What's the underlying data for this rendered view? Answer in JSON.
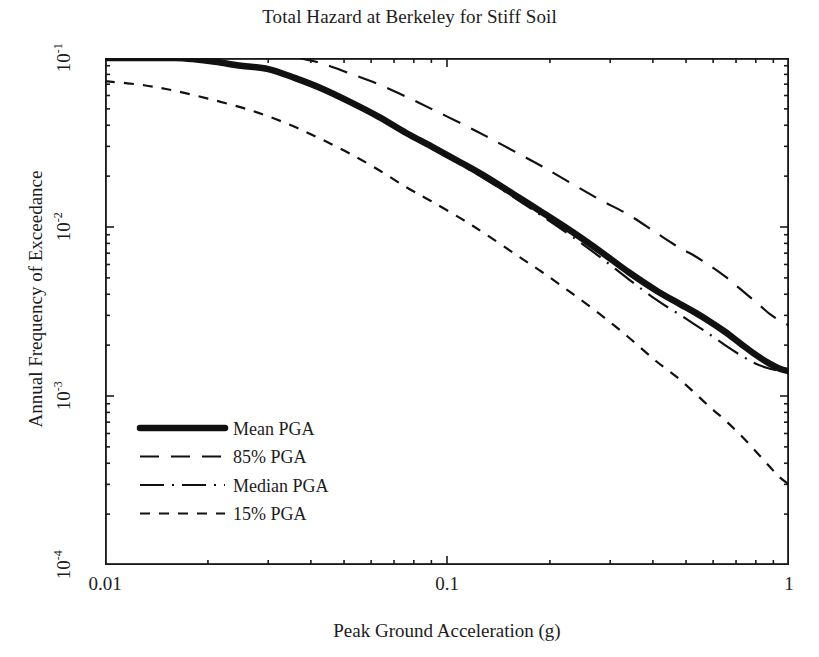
{
  "chart_data": {
    "type": "line",
    "title": "Total Hazard at Berkeley for Stiff Soil",
    "xlabel": "Peak Ground Acceleration (g)",
    "ylabel": "Annual Frequency of Exceedance",
    "xscale": "log",
    "yscale": "log",
    "xlim": [
      0.01,
      1
    ],
    "ylim": [
      0.0001,
      0.1
    ],
    "grid": false,
    "legend_position": "lower-left-inside",
    "xtick_labels": [
      "0.01",
      "0.1",
      "1"
    ],
    "xtick_values": [
      0.01,
      0.1,
      1
    ],
    "ytick_labels": [
      "10-1",
      "10-2",
      "10-3",
      "10-4"
    ],
    "ytick_values": [
      0.1,
      0.01,
      0.001,
      0.0001
    ],
    "ytick_mantissa": "10",
    "ytick_exponents": [
      "-1",
      "-2",
      "-3",
      "-4"
    ],
    "series": [
      {
        "name": "Mean PGA",
        "style": "thick-solid",
        "linewidth": 6,
        "dash": "none",
        "x": [
          0.01,
          0.013,
          0.016,
          0.018,
          0.021,
          0.025,
          0.03,
          0.036,
          0.043,
          0.052,
          0.063,
          0.076,
          0.09,
          0.11,
          0.13,
          0.16,
          0.19,
          0.23,
          0.28,
          0.34,
          0.41,
          0.48,
          0.52,
          0.58,
          0.65,
          0.72,
          0.8,
          0.88,
          0.94,
          1.0
        ],
        "y": [
          0.1,
          0.1,
          0.1,
          0.0985,
          0.095,
          0.09,
          0.086,
          0.076,
          0.066,
          0.055,
          0.045,
          0.036,
          0.03,
          0.024,
          0.0198,
          0.0152,
          0.0122,
          0.0095,
          0.0072,
          0.0054,
          0.0042,
          0.0035,
          0.0032,
          0.0028,
          0.0024,
          0.00205,
          0.00175,
          0.00155,
          0.00145,
          0.0014
        ]
      },
      {
        "name": "85% PGA",
        "style": "long-dash",
        "linewidth": 2,
        "dash": "18,11",
        "x": [
          0.037,
          0.043,
          0.052,
          0.063,
          0.076,
          0.09,
          0.11,
          0.13,
          0.16,
          0.19,
          0.23,
          0.28,
          0.34,
          0.41,
          0.48,
          0.52,
          0.58,
          0.65,
          0.72,
          0.8,
          0.88,
          0.94,
          1.0
        ],
        "y": [
          0.1,
          0.093,
          0.081,
          0.07,
          0.059,
          0.05,
          0.041,
          0.0345,
          0.0275,
          0.0228,
          0.0182,
          0.0145,
          0.0118,
          0.0092,
          0.0075,
          0.0069,
          0.006,
          0.0051,
          0.0043,
          0.0036,
          0.00305,
          0.0028,
          0.00262
        ]
      },
      {
        "name": "Median PGA",
        "style": "dash-dot",
        "linewidth": 2,
        "dash": "22,7,2,7",
        "x": [
          0.02,
          0.025,
          0.03,
          0.036,
          0.043,
          0.052,
          0.063,
          0.076,
          0.09,
          0.11,
          0.13,
          0.16,
          0.19,
          0.23,
          0.28,
          0.34,
          0.41,
          0.48,
          0.52,
          0.58,
          0.65,
          0.72,
          0.8,
          0.88,
          0.94,
          1.0
        ],
        "y": [
          0.095,
          0.0905,
          0.0855,
          0.0755,
          0.065,
          0.0542,
          0.0443,
          0.0352,
          0.0293,
          0.0233,
          0.0191,
          0.0146,
          0.0116,
          0.0089,
          0.00665,
          0.0049,
          0.0037,
          0.00302,
          0.00272,
          0.00235,
          0.002,
          0.00175,
          0.00155,
          0.00145,
          0.00141,
          0.00138
        ]
      },
      {
        "name": "15% PGA",
        "style": "short-dash",
        "linewidth": 2,
        "dash": "9,9",
        "x": [
          0.01,
          0.013,
          0.016,
          0.02,
          0.025,
          0.03,
          0.036,
          0.043,
          0.052,
          0.063,
          0.076,
          0.09,
          0.11,
          0.13,
          0.16,
          0.19,
          0.23,
          0.28,
          0.34,
          0.41,
          0.48,
          0.58,
          0.65,
          0.72,
          0.8,
          0.88,
          0.94,
          1.0
        ],
        "y": [
          0.073,
          0.069,
          0.064,
          0.0575,
          0.051,
          0.0452,
          0.039,
          0.033,
          0.0272,
          0.0218,
          0.0172,
          0.0142,
          0.0112,
          0.00905,
          0.0068,
          0.0054,
          0.0041,
          0.00305,
          0.00222,
          0.0016,
          0.00125,
          0.00088,
          0.00072,
          0.00059,
          0.00047,
          0.00038,
          0.00033,
          0.0003
        ]
      }
    ],
    "legend": [
      {
        "label": "Mean PGA",
        "style": "thick-solid"
      },
      {
        "label": "85% PGA",
        "style": "long-dash"
      },
      {
        "label": "Median PGA",
        "style": "dash-dot"
      },
      {
        "label": "15% PGA",
        "style": "short-dash"
      }
    ]
  }
}
